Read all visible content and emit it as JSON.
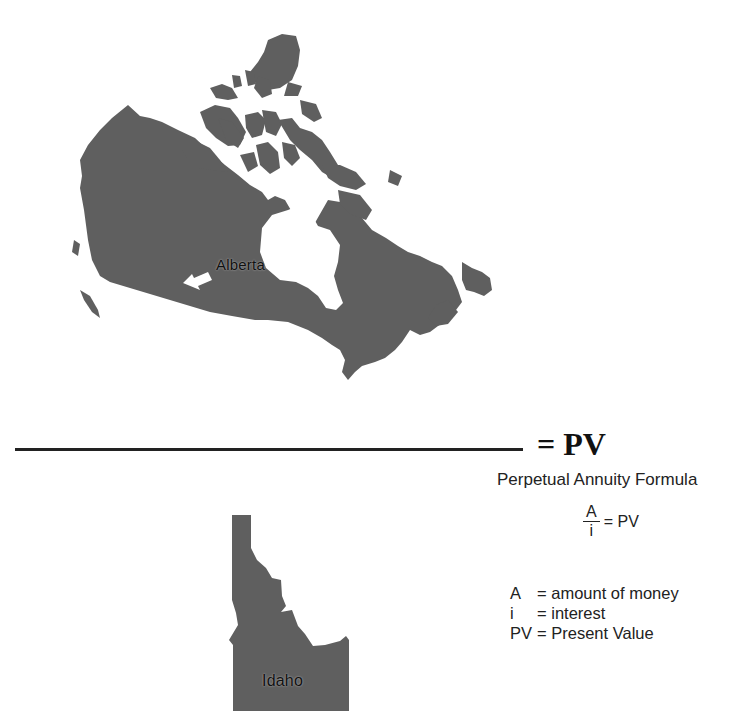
{
  "maps": {
    "canada": {
      "label": "Alberta",
      "fill": "#5f5f5f"
    },
    "idaho": {
      "label": "Idaho",
      "fill": "#5f5f5f"
    }
  },
  "equation": {
    "result": "= PV"
  },
  "formula": {
    "title": "Perpetual Annuity Formula",
    "numerator": "A",
    "denominator": "i",
    "equals": "= PV",
    "definitions": [
      {
        "symbol": "A",
        "meaning": "= amount of money"
      },
      {
        "symbol": "i",
        "meaning": "= interest"
      },
      {
        "symbol": "PV",
        "meaning": "= Present Value"
      }
    ]
  }
}
